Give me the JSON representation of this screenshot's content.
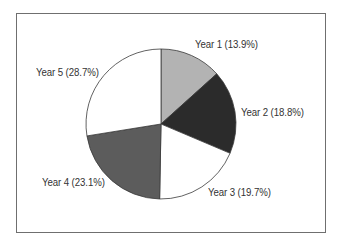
{
  "chart_data": {
    "type": "pie",
    "title": "",
    "categories": [
      "Year 1",
      "Year 2",
      "Year 3",
      "Year 4",
      "Year 5"
    ],
    "values": [
      13.9,
      18.8,
      19.7,
      23.1,
      28.7
    ],
    "unit": "%",
    "start_angle": "12 o'clock",
    "direction": "clockwise",
    "colors": [
      "#b3b3b3",
      "#2b2b2b",
      "#ffffff",
      "#5c5c5c",
      "#ffffff"
    ],
    "labels": [
      "Year 1 (13.9%)",
      "Year 2 (18.8%)",
      "Year 3 (19.7%)",
      "Year 4 (23.1%)",
      "Year 5 (28.7%)"
    ],
    "legend": "none (labels beside slices)"
  },
  "labels": {
    "y1": "Year 1 (13.9%)",
    "y2": "Year 2 (18.8%)",
    "y3": "Year 3 (19.7%)",
    "y4": "Year 4 (23.1%)",
    "y5": "Year 5 (28.7%)"
  }
}
